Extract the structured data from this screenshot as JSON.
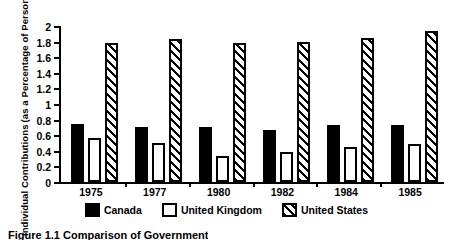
{
  "chart_data": {
    "type": "bar",
    "title": "",
    "xlabel": "",
    "ylabel_line1": "Individual Contributions",
    "ylabel_line2": "(as a Percentage of Personal Income)",
    "categories": [
      "1975",
      "1977",
      "1980",
      "1982",
      "1984",
      "1985"
    ],
    "series": [
      {
        "name": "Canada",
        "style": "solid-black",
        "values": [
          0.74,
          0.71,
          0.7,
          0.67,
          0.73,
          0.73
        ]
      },
      {
        "name": "United Kingdom",
        "style": "white-outline",
        "values": [
          0.56,
          0.5,
          0.33,
          0.38,
          0.45,
          0.49
        ]
      },
      {
        "name": "United States",
        "style": "diagonal-hatch",
        "values": [
          1.78,
          1.83,
          1.78,
          1.79,
          1.85,
          1.93
        ]
      }
    ],
    "ylim": [
      0,
      2
    ],
    "ytick_values": [
      0,
      0.2,
      0.4,
      0.6,
      0.8,
      1,
      1.2,
      1.4,
      1.6,
      1.8,
      2
    ],
    "ytick_labels": [
      "0",
      "0.2",
      "0.4",
      "0.6",
      "0.8",
      "1",
      "1.2",
      "1.4",
      "1.6",
      "1.8",
      "2"
    ],
    "grid": false,
    "legend_position": "bottom-center"
  },
  "legend": {
    "items": [
      {
        "label": "Canada",
        "swatch": "solid-black-swatch"
      },
      {
        "label": "United Kingdom",
        "swatch": "white-outline-swatch"
      },
      {
        "label": "United States",
        "swatch": "diagonal-hatch-swatch"
      }
    ]
  },
  "caption": {
    "text": "Figure 1.1   Comparison of Government"
  },
  "colors": {
    "ink": "#000000",
    "paper": "#ffffff"
  }
}
